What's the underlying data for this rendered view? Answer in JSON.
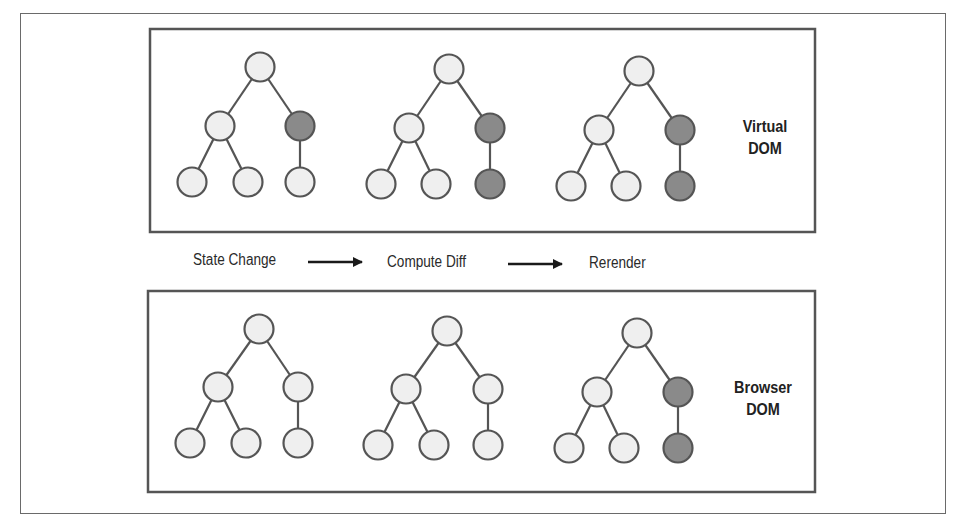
{
  "diagram": {
    "type": "virtual-dom-reconciliation",
    "colors": {
      "node_unchanged": "#efefef",
      "node_changed": "#8a8a8a",
      "node_stroke": "#555555",
      "edge": "#555555",
      "box_border": "#555555"
    },
    "panels": [
      {
        "id": "virtual-dom",
        "label_line1": "Virtual",
        "label_line2": "DOM",
        "trees": [
          {
            "changed": [
              "right"
            ]
          },
          {
            "changed": [
              "right",
              "right-leaf"
            ]
          },
          {
            "changed": [
              "right",
              "right-leaf"
            ]
          }
        ]
      },
      {
        "id": "browser-dom",
        "label_line1": "Browser",
        "label_line2": "DOM",
        "trees": [
          {
            "changed": []
          },
          {
            "changed": []
          },
          {
            "changed": [
              "right",
              "right-leaf"
            ]
          }
        ]
      }
    ],
    "steps": [
      {
        "label": "State Change"
      },
      {
        "label": "Compute Diff"
      },
      {
        "label": "Rerender"
      }
    ]
  }
}
